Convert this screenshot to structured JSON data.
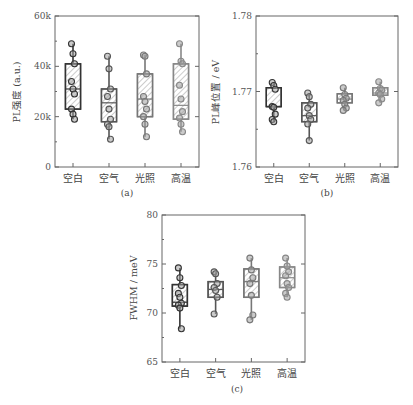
{
  "chart_data": [
    {
      "type": "box",
      "panel_label": "(a)",
      "title": "",
      "xlabel": "",
      "ylabel": "PL强度 (a.u.)",
      "categories": [
        "空白",
        "空气",
        "光照",
        "高温"
      ],
      "yticks": [
        "0",
        "20k",
        "40k",
        "60k"
      ],
      "ylim": [
        0,
        60000
      ],
      "grid": false,
      "boxes": [
        {
          "name": "空白",
          "q1": 23000,
          "median": 31000,
          "q3": 41000,
          "whisker_low": 19000,
          "whisker_high": 49000,
          "points": [
            49000,
            45000,
            41000,
            34000,
            31000,
            29000,
            23000,
            21000,
            19000
          ],
          "color": "#333333"
        },
        {
          "name": "空气",
          "q1": 18000,
          "median": 25500,
          "q3": 31000,
          "whisker_low": 11000,
          "whisker_high": 44000,
          "points": [
            44000,
            39000,
            31000,
            28000,
            23000,
            19000,
            17000,
            16000,
            11000
          ],
          "color": "#555555"
        },
        {
          "name": "光照",
          "q1": 20000,
          "median": 27000,
          "q3": 37000,
          "whisker_low": 12000,
          "whisker_high": 44500,
          "points": [
            44500,
            44000,
            37000,
            28000,
            26000,
            23000,
            20000,
            17000,
            12000
          ],
          "color": "#777777"
        },
        {
          "name": "高温",
          "q1": 19000,
          "median": 24500,
          "q3": 41000,
          "whisker_low": 14000,
          "whisker_high": 49000,
          "points": [
            49000,
            42000,
            41000,
            32500,
            27000,
            22000,
            19500,
            17000,
            14000
          ],
          "color": "#888888"
        }
      ]
    },
    {
      "type": "box",
      "panel_label": "(b)",
      "title": "",
      "xlabel": "",
      "ylabel": "PL峰位置 / eV",
      "categories": [
        "空白",
        "空气",
        "光照",
        "高温"
      ],
      "yticks": [
        "1.76",
        "1.77",
        "1.78"
      ],
      "ylim": [
        1.76,
        1.78
      ],
      "grid": false,
      "boxes": [
        {
          "name": "空白",
          "q1": 1.768,
          "median": 1.768,
          "q3": 1.7705,
          "whisker_low": 1.766,
          "whisker_high": 1.7712,
          "points": [
            1.7712,
            1.7708,
            1.7703,
            1.768,
            1.7679,
            1.767,
            1.7663,
            1.766
          ],
          "color": "#333333"
        },
        {
          "name": "空气",
          "q1": 1.766,
          "median": 1.7668,
          "q3": 1.7685,
          "whisker_low": 1.7635,
          "whisker_high": 1.7698,
          "points": [
            1.7698,
            1.7693,
            1.7683,
            1.7678,
            1.7668,
            1.7663,
            1.7657,
            1.7635
          ],
          "color": "#555555"
        },
        {
          "name": "光照",
          "q1": 1.7685,
          "median": 1.769,
          "q3": 1.7697,
          "whisker_low": 1.7675,
          "whisker_high": 1.7705,
          "points": [
            1.7705,
            1.7696,
            1.7691,
            1.7688,
            1.7683,
            1.7678,
            1.7675
          ],
          "color": "#777777"
        },
        {
          "name": "高温",
          "q1": 1.7695,
          "median": 1.7698,
          "q3": 1.7705,
          "whisker_low": 1.7685,
          "whisker_high": 1.7713,
          "points": [
            1.7713,
            1.7704,
            1.7702,
            1.7698,
            1.7696,
            1.769,
            1.7685
          ],
          "color": "#888888"
        }
      ]
    },
    {
      "type": "box",
      "panel_label": "(c)",
      "title": "",
      "xlabel": "",
      "ylabel": "FWHM / meV",
      "categories": [
        "空白",
        "空气",
        "光照",
        "高温"
      ],
      "yticks": [
        "65",
        "70",
        "75",
        "80"
      ],
      "ylim": [
        65,
        80
      ],
      "grid": false,
      "boxes": [
        {
          "name": "空白",
          "q1": 70.7,
          "median": 71.1,
          "q3": 72.9,
          "whisker_low": 68.4,
          "whisker_high": 74.6,
          "points": [
            74.6,
            73.6,
            72.8,
            72.0,
            71.6,
            71.0,
            70.8,
            70.5,
            68.4
          ],
          "color": "#333333"
        },
        {
          "name": "空气",
          "q1": 71.6,
          "median": 72.4,
          "q3": 73.2,
          "whisker_low": 69.9,
          "whisker_high": 74.2,
          "points": [
            74.2,
            74.0,
            73.0,
            72.6,
            72.3,
            71.6,
            69.9
          ],
          "color": "#555555"
        },
        {
          "name": "光照",
          "q1": 71.6,
          "median": 73.2,
          "q3": 74.5,
          "whisker_low": 69.3,
          "whisker_high": 75.6,
          "points": [
            75.6,
            74.4,
            73.6,
            73.0,
            71.8,
            69.8,
            69.3
          ],
          "color": "#777777"
        },
        {
          "name": "高温",
          "q1": 72.6,
          "median": 73.6,
          "q3": 74.7,
          "whisker_low": 71.6,
          "whisker_high": 75.6,
          "points": [
            75.6,
            74.8,
            74.2,
            73.8,
            73.0,
            72.6,
            72.0,
            71.6
          ],
          "color": "#888888"
        }
      ]
    }
  ]
}
